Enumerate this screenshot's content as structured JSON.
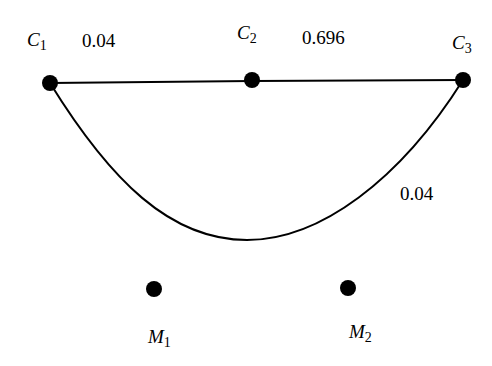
{
  "nodes": [
    {
      "id": "C1",
      "name": "C",
      "sub": "1",
      "x": 50,
      "y": 83
    },
    {
      "id": "C2",
      "name": "C",
      "sub": "2",
      "x": 252,
      "y": 80
    },
    {
      "id": "C3",
      "name": "C",
      "sub": "3",
      "x": 463,
      "y": 80
    },
    {
      "id": "M1",
      "name": "M",
      "sub": "1",
      "x": 154,
      "y": 289
    },
    {
      "id": "M2",
      "name": "M",
      "sub": "2",
      "x": 348,
      "y": 288
    }
  ],
  "edges": [
    {
      "from": "C1",
      "to": "C2",
      "weight": "0.04",
      "shape": "straight"
    },
    {
      "from": "C2",
      "to": "C3",
      "weight": "0.696",
      "shape": "straight"
    },
    {
      "from": "C1",
      "to": "C3",
      "weight": "0.04",
      "shape": "curve"
    }
  ],
  "labels": {
    "c1": {
      "name": "C",
      "sub": "1"
    },
    "c2": {
      "name": "C",
      "sub": "2"
    },
    "c3": {
      "name": "C",
      "sub": "3"
    },
    "m1": {
      "name": "M",
      "sub": "1"
    },
    "m2": {
      "name": "M",
      "sub": "2"
    },
    "w_c1_c2": "0.04",
    "w_c2_c3": "0.696",
    "w_c1_c3": "0.04"
  }
}
